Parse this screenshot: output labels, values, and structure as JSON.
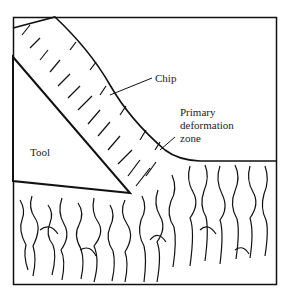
{
  "diagram": {
    "type": "orthogonal metal cutting schematic",
    "labels": {
      "chip": "Chip",
      "primary_zone_line1": "Primary",
      "primary_zone_line2": "deformation",
      "primary_zone_line3": "zone",
      "tool": "Tool"
    },
    "colors": {
      "ink": "#111111",
      "background": "#ffffff"
    }
  }
}
